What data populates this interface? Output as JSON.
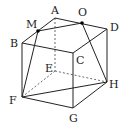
{
  "diagram": {
    "type": "cube-geometry",
    "vertices": {
      "A": {
        "label": "A",
        "x": 55,
        "y": 18,
        "lx": 51,
        "ly": 14
      },
      "O": {
        "label": "O",
        "x": 82,
        "y": 23,
        "lx": 78,
        "ly": 16
      },
      "D": {
        "label": "D",
        "x": 107,
        "y": 29,
        "lx": 110,
        "ly": 31
      },
      "M": {
        "label": "M",
        "x": 38,
        "y": 31,
        "lx": 26,
        "ly": 28
      },
      "B": {
        "label": "B",
        "x": 22,
        "y": 43,
        "lx": 10,
        "ly": 47
      },
      "C": {
        "label": "C",
        "x": 73,
        "y": 53,
        "lx": 76,
        "ly": 64
      },
      "E": {
        "label": "E",
        "x": 55,
        "y": 71,
        "lx": 45,
        "ly": 72
      },
      "H": {
        "label": "H",
        "x": 107,
        "y": 82,
        "lx": 109,
        "ly": 88
      },
      "F": {
        "label": "F",
        "x": 22,
        "y": 97,
        "lx": 9,
        "ly": 104
      },
      "G": {
        "label": "G",
        "x": 73,
        "y": 108,
        "lx": 69,
        "ly": 122
      }
    },
    "solid_edges": [
      [
        "A",
        "D"
      ],
      [
        "A",
        "B"
      ],
      [
        "B",
        "C"
      ],
      [
        "C",
        "D"
      ],
      [
        "B",
        "F"
      ],
      [
        "C",
        "G"
      ],
      [
        "D",
        "H"
      ],
      [
        "F",
        "G"
      ],
      [
        "G",
        "H"
      ],
      [
        "M",
        "O"
      ],
      [
        "M",
        "F"
      ],
      [
        "O",
        "H"
      ],
      [
        "F",
        "H"
      ]
    ],
    "hidden_edges": [
      [
        "A",
        "E"
      ],
      [
        "E",
        "F"
      ],
      [
        "E",
        "H"
      ]
    ],
    "marked_points": [
      "M",
      "O"
    ]
  }
}
